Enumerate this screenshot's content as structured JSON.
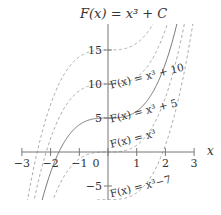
{
  "chart_data": {
    "type": "line",
    "title": "F(x) = x³ + C",
    "xlabel": "x",
    "ylabel": "",
    "xlim": [
      -3,
      3
    ],
    "ylim": [
      -7,
      18
    ],
    "x_ticks": [
      -3,
      -2,
      -1,
      0,
      1,
      2,
      3
    ],
    "y_ticks": [
      -5,
      5,
      10,
      15
    ],
    "grid": false,
    "series": [
      {
        "name": "F(x) = x³ + 15",
        "C": 15,
        "style": "dashed"
      },
      {
        "name": "F(x) = x³ + 10",
        "C": 10,
        "style": "dashed",
        "label": "F(x) = x³ + 10"
      },
      {
        "name": "F(x) = x³ + 5",
        "C": 5,
        "style": "solid",
        "label": "F(x) = x³ + 5"
      },
      {
        "name": "F(x) = x³",
        "C": 0,
        "style": "dashed",
        "label": "F(x) = x³"
      },
      {
        "name": "F(x) = x³ − 7",
        "C": -7,
        "style": "dashed",
        "label": "F(x) = x³−7"
      }
    ]
  },
  "labels": {
    "title": "F(x) = x³ + C",
    "x_axis": "x",
    "curve_10": "F(x) = x³ + 10",
    "curve_5": "F(x) = x³ + 5",
    "curve_0": "F(x) = x³",
    "curve_m7": "F(x) = x³−7"
  }
}
